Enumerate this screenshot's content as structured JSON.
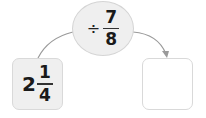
{
  "diagram": {
    "operation": {
      "operator": "÷",
      "numerator": "7",
      "denominator": "8"
    },
    "input": {
      "whole": "2",
      "numerator": "1",
      "denominator": "4"
    },
    "output": {
      "value": ""
    },
    "colors": {
      "fill": "#efefef",
      "border": "#d4d4d4",
      "arrow": "#9a9a9a",
      "text": "#1a1a1a"
    }
  }
}
